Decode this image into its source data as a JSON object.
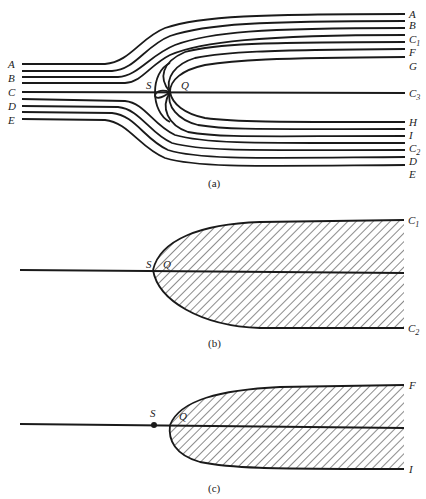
{
  "figure": {
    "panels": [
      {
        "id": "a",
        "caption": "(a)",
        "left_labels": [
          "A",
          "B",
          "C",
          "D",
          "E"
        ],
        "right_labels": [
          {
            "text": "A",
            "sub": ""
          },
          {
            "text": "B",
            "sub": ""
          },
          {
            "text": "C",
            "sub": "1"
          },
          {
            "text": "F",
            "sub": ""
          },
          {
            "text": "G",
            "sub": ""
          },
          {
            "text": "C",
            "sub": "3"
          },
          {
            "text": "H",
            "sub": ""
          },
          {
            "text": "I",
            "sub": ""
          },
          {
            "text": "C",
            "sub": "2"
          },
          {
            "text": "D",
            "sub": ""
          },
          {
            "text": "E",
            "sub": ""
          }
        ],
        "point_labels": {
          "s": "S",
          "q": "Q"
        }
      },
      {
        "id": "b",
        "caption": "(b)",
        "right_labels": [
          {
            "text": "C",
            "sub": "1"
          },
          {
            "text": "C",
            "sub": "2"
          }
        ],
        "point_labels": {
          "s": "S",
          "q": "Q"
        }
      },
      {
        "id": "c",
        "caption": "(c)",
        "right_labels": [
          {
            "text": "F",
            "sub": ""
          },
          {
            "text": "I",
            "sub": ""
          }
        ],
        "point_labels": {
          "s": "S",
          "q": "Q"
        }
      }
    ],
    "colors": {
      "ink": "#1a1a1a",
      "background": "#ffffff"
    }
  }
}
